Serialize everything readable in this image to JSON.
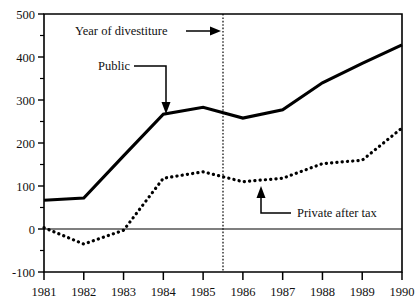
{
  "chart_data": {
    "type": "line",
    "title": "",
    "xlabel": "",
    "ylabel": "",
    "categories": [
      "1981",
      "1982",
      "1983",
      "1984",
      "1985",
      "1986",
      "1987",
      "1988",
      "1989",
      "1990"
    ],
    "x": [
      1981,
      1982,
      1983,
      1984,
      1985,
      1986,
      1987,
      1988,
      1989,
      1990
    ],
    "xlim": [
      1981,
      1990
    ],
    "ylim": [
      -100,
      500
    ],
    "ytick_labels": [
      "500",
      "400",
      "300",
      "200",
      "100",
      "0",
      "-100"
    ],
    "yticks": [
      500,
      400,
      300,
      200,
      100,
      0,
      -100
    ],
    "yminor_ticks": [
      450,
      350,
      250,
      150,
      50,
      -50
    ],
    "grid": false,
    "legend_position": "inline-annotations",
    "zero_line": 0,
    "series": [
      {
        "name": "Public",
        "style": "solid",
        "values": [
          67,
          72,
          170,
          267,
          283,
          258,
          277,
          340,
          385,
          428
        ]
      },
      {
        "name": "Private after tax",
        "style": "dotted",
        "values": [
          3,
          -35,
          -3,
          118,
          133,
          110,
          118,
          152,
          160,
          235
        ]
      }
    ],
    "annotations": [
      {
        "id": "year-of-divestiture",
        "text": "Year of divestiture",
        "kind": "vertical-marker-callout",
        "marker_x": 1985.5,
        "marker_style": "dotted-vertical",
        "arrow": "right"
      },
      {
        "id": "public-callout",
        "text": "Public",
        "kind": "series-callout",
        "target_series": "Public",
        "target_x": 1984.5,
        "arrow": "down"
      },
      {
        "id": "private-after-tax-callout",
        "text": "Private after tax",
        "kind": "series-callout",
        "target_series": "Private after tax",
        "target_x": 1986.5,
        "arrow": "up"
      }
    ],
    "colors": {
      "line": "#000000",
      "axis": "#000000",
      "background": "#ffffff",
      "text": "#111111"
    }
  }
}
